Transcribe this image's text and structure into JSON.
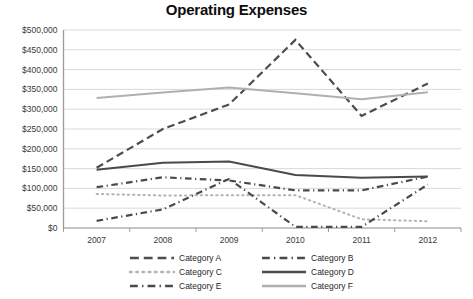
{
  "chart_data": {
    "type": "line",
    "title": "Operating Expenses",
    "xlabel": "",
    "ylabel": "",
    "x": [
      "2007",
      "2008",
      "2009",
      "2010",
      "2011",
      "2012"
    ],
    "categories": [
      "2007",
      "2008",
      "2009",
      "2010",
      "2011",
      "2012"
    ],
    "ylim": [
      0,
      500000
    ],
    "ytick_labels": [
      "$500,000",
      "$450,000",
      "$400,000",
      "$350,000",
      "$300,000",
      "$250,000",
      "$200,000",
      "$150,000",
      "$100,000",
      "$50,000",
      "$0"
    ],
    "ytick_values": [
      500000,
      450000,
      400000,
      350000,
      300000,
      250000,
      200000,
      150000,
      100000,
      50000,
      0
    ],
    "ytick_step": 50000,
    "grid": true,
    "grid_axis": "y",
    "legend_position": "bottom",
    "legend_columns": 2,
    "series": [
      {
        "name": "Category A",
        "style": "dashed",
        "color": "#4d4d4d",
        "width": 2.2,
        "values": [
          152000,
          250000,
          312000,
          475000,
          283000,
          365000
        ]
      },
      {
        "name": "Category B",
        "style": "dash-dot",
        "color": "#4a4a4a",
        "width": 2.2,
        "values": [
          103000,
          128000,
          120000,
          95000,
          95000,
          130000
        ]
      },
      {
        "name": "Category C",
        "style": "dotted",
        "color": "#b3b3b3",
        "width": 2.0,
        "values": [
          86000,
          82000,
          83000,
          83000,
          22000,
          17000
        ]
      },
      {
        "name": "Category D",
        "style": "solid",
        "color": "#4a4a4a",
        "width": 2.0,
        "values": [
          147000,
          165000,
          168000,
          134000,
          127000,
          130000
        ]
      },
      {
        "name": "Category E",
        "style": "dash-dot",
        "color": "#4a4a4a",
        "width": 2.2,
        "values": [
          18000,
          47000,
          124000,
          3000,
          3000,
          110000
        ]
      },
      {
        "name": "Category F",
        "style": "solid",
        "color": "#b0b0b0",
        "width": 2.0,
        "values": [
          328000,
          342000,
          355000,
          340000,
          325000,
          343000
        ]
      }
    ]
  },
  "legend": {
    "entries": [
      {
        "label": "Category A"
      },
      {
        "label": "Category B"
      },
      {
        "label": "Category C"
      },
      {
        "label": "Category D"
      },
      {
        "label": "Category E"
      },
      {
        "label": "Category F"
      }
    ]
  }
}
